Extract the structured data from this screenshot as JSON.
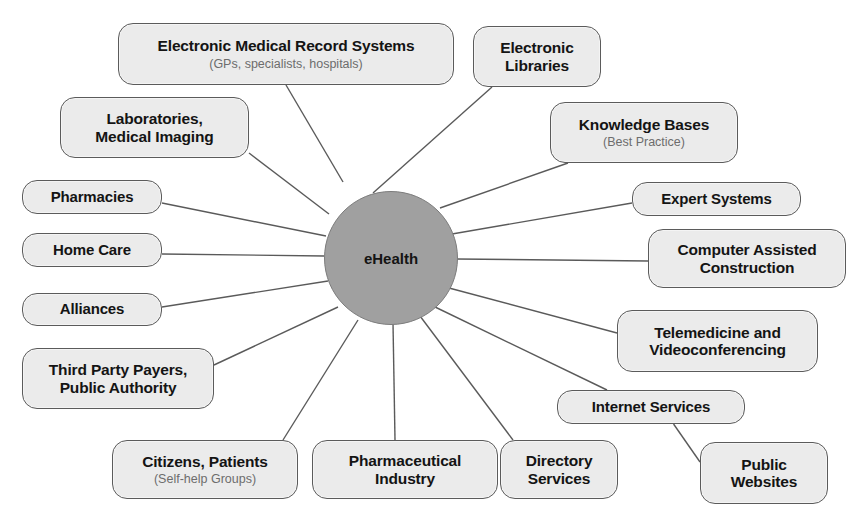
{
  "diagram": {
    "type": "hub-and-spoke concept map",
    "hub": {
      "label": "eHealth",
      "cx": 390,
      "cy": 257,
      "r": 66,
      "fill": "#a0a0a0",
      "stroke": "#7c7c7c"
    },
    "style": {
      "node_fill": "#ebebeb",
      "node_stroke": "#5b5b5b",
      "text_color": "#141414",
      "sub_text_color": "#6d6d6d",
      "edge_color": "#5a5a5a",
      "background": "#ffffff"
    },
    "nodes": [
      {
        "id": "emr",
        "title": "Electronic Medical Record Systems",
        "sub": "(GPs, specialists, hospitals)",
        "x": 118,
        "y": 23,
        "w": 336,
        "h": 62,
        "anchor": [
          286,
          85
        ],
        "spoke": [
          343,
          182
        ]
      },
      {
        "id": "elibraries",
        "title": "Electronic\nLibraries",
        "sub": "",
        "x": 473,
        "y": 26,
        "w": 128,
        "h": 61,
        "anchor": [
          492,
          87
        ],
        "spoke": [
          373,
          193
        ]
      },
      {
        "id": "labs",
        "title": "Laboratories,\nMedical Imaging",
        "sub": "",
        "x": 60,
        "y": 97,
        "w": 189,
        "h": 61,
        "anchor": [
          249,
          153
        ],
        "spoke": [
          329,
          214
        ]
      },
      {
        "id": "knowledge",
        "title": "Knowledge Bases",
        "sub": "(Best Practice)",
        "x": 550,
        "y": 102,
        "w": 188,
        "h": 61,
        "anchor": [
          568,
          163
        ],
        "spoke": [
          440,
          208
        ]
      },
      {
        "id": "pharmacies",
        "title": "Pharmacies",
        "sub": "",
        "x": 22,
        "y": 180,
        "w": 140,
        "h": 34,
        "anchor": [
          162,
          203
        ],
        "spoke": [
          326,
          236
        ]
      },
      {
        "id": "expert",
        "title": "Expert Systems",
        "sub": "",
        "x": 632,
        "y": 182,
        "w": 169,
        "h": 34,
        "anchor": [
          632,
          203
        ],
        "spoke": [
          452,
          234
        ]
      },
      {
        "id": "cac",
        "title": "Computer Assisted\nConstruction",
        "sub": "",
        "x": 648,
        "y": 229,
        "w": 198,
        "h": 59,
        "anchor": [
          648,
          261
        ],
        "spoke": [
          456,
          259
        ]
      },
      {
        "id": "homecare",
        "title": "Home Care",
        "sub": "",
        "x": 22,
        "y": 233,
        "w": 140,
        "h": 34,
        "anchor": [
          162,
          254
        ],
        "spoke": [
          324,
          256
        ]
      },
      {
        "id": "alliances",
        "title": "Alliances",
        "sub": "",
        "x": 22,
        "y": 293,
        "w": 140,
        "h": 33,
        "anchor": [
          162,
          307
        ],
        "spoke": [
          328,
          281
        ]
      },
      {
        "id": "telemedicine",
        "title": "Telemedicine and\nVideoconferencing",
        "sub": "",
        "x": 617,
        "y": 310,
        "w": 201,
        "h": 62,
        "anchor": [
          617,
          333
        ],
        "spoke": [
          449,
          288
        ]
      },
      {
        "id": "thirdparty",
        "title": "Third Party Payers,\nPublic Authority",
        "sub": "",
        "x": 22,
        "y": 348,
        "w": 192,
        "h": 61,
        "anchor": [
          214,
          365
        ],
        "spoke": [
          338,
          307
        ]
      },
      {
        "id": "internet",
        "title": "Internet Services",
        "sub": "",
        "x": 557,
        "y": 390,
        "w": 188,
        "h": 34,
        "anchor": [
          607,
          390
        ],
        "spoke": [
          433,
          306
        ]
      },
      {
        "id": "citizens",
        "title": "Citizens, Patients",
        "sub": "(Self-help Groups)",
        "x": 112,
        "y": 440,
        "w": 186,
        "h": 59,
        "anchor": [
          283,
          440
        ],
        "spoke": [
          358,
          320
        ]
      },
      {
        "id": "pharma",
        "title": "Pharmaceutical\nIndustry",
        "sub": "",
        "x": 312,
        "y": 440,
        "w": 186,
        "h": 59,
        "anchor": [
          395,
          440
        ],
        "spoke": [
          393,
          323
        ]
      },
      {
        "id": "directory",
        "title": "Directory\nServices",
        "sub": "",
        "x": 500,
        "y": 440,
        "w": 118,
        "h": 59,
        "anchor": [
          513,
          440
        ],
        "spoke": [
          420,
          316
        ]
      },
      {
        "id": "publicweb",
        "title": "Public\nWebsites",
        "sub": "",
        "x": 700,
        "y": 442,
        "w": 128,
        "h": 62,
        "anchor": [
          700,
          462
        ],
        "spoke": [
          656,
          424
        ]
      }
    ],
    "edges": [
      {
        "from": "hub",
        "to": "emr"
      },
      {
        "from": "hub",
        "to": "elibraries"
      },
      {
        "from": "hub",
        "to": "labs"
      },
      {
        "from": "hub",
        "to": "knowledge"
      },
      {
        "from": "hub",
        "to": "pharmacies"
      },
      {
        "from": "hub",
        "to": "expert"
      },
      {
        "from": "hub",
        "to": "cac"
      },
      {
        "from": "hub",
        "to": "homecare"
      },
      {
        "from": "hub",
        "to": "alliances"
      },
      {
        "from": "hub",
        "to": "telemedicine"
      },
      {
        "from": "hub",
        "to": "thirdparty"
      },
      {
        "from": "hub",
        "to": "internet"
      },
      {
        "from": "hub",
        "to": "citizens"
      },
      {
        "from": "hub",
        "to": "pharma"
      },
      {
        "from": "hub",
        "to": "directory"
      },
      {
        "from": "internet",
        "to": "publicweb"
      }
    ]
  }
}
